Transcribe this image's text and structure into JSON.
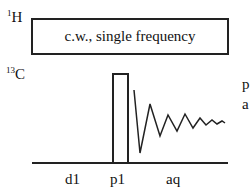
{
  "channels": {
    "proton": {
      "mass": "1",
      "element": "H"
    },
    "carbon": {
      "mass": "13",
      "element": "C"
    }
  },
  "decoupling_box": {
    "label": "c.w., single frequency"
  },
  "timing_labels": [
    "d1",
    "p1",
    "aq"
  ],
  "right_cut_text": [
    "p",
    "a"
  ],
  "colors": {
    "line": "#222222",
    "background": "#ffffff"
  }
}
